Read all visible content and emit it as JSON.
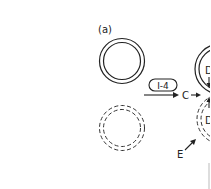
{
  "figure": {
    "panel_label": "(a)",
    "box_label": "I-4",
    "label_c": "C",
    "label_d_top": "D",
    "label_d_bottom": "D",
    "label_e": "E",
    "colors": {
      "stroke": "#222222",
      "background": "#ffffff"
    }
  }
}
